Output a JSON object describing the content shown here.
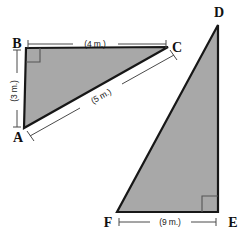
{
  "figure": {
    "background_color": "#ffffff",
    "fill_color": "#a8a8a8",
    "outline_color": "#171717",
    "dimension_line_color": "#4a4a4a"
  },
  "triangle_abc": {
    "name": "triangle-abc",
    "vertices": {
      "a": {
        "label": "A",
        "x": 24,
        "y": 128
      },
      "b": {
        "label": "B",
        "x": 26,
        "y": 48
      },
      "c": {
        "label": "C",
        "x": 168,
        "y": 47
      }
    },
    "right_angle_at": "B",
    "sides": [
      {
        "name": "bc-top",
        "label": "(4 m.)",
        "value": 4,
        "unit": "m"
      },
      {
        "name": "ab-left",
        "label": "(3 m.)",
        "value": 3,
        "unit": "m"
      },
      {
        "name": "ac-hypotenuse",
        "label": "(5 m.)",
        "value": 5,
        "unit": "m"
      }
    ]
  },
  "triangle_def": {
    "name": "triangle-def",
    "vertices": {
      "d": {
        "label": "D",
        "x": 218,
        "y": 25
      },
      "e": {
        "label": "E",
        "x": 218,
        "y": 212
      },
      "f": {
        "label": "F",
        "x": 117,
        "y": 212
      }
    },
    "right_angle_at": "E",
    "sides": [
      {
        "name": "fe-bottom",
        "label": "(9 m.)",
        "value": 9,
        "unit": "m"
      }
    ]
  }
}
